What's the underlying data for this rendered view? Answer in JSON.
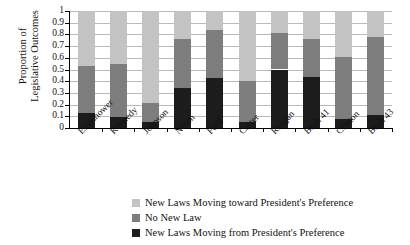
{
  "chart_data": {
    "type": "bar",
    "title": "",
    "xlabel": "",
    "ylabel": "Proportion of Legislative Outcomes",
    "ylabel_line1": "Proportion of",
    "ylabel_line2": "Legislative Outcomes",
    "ylim": [
      0,
      1
    ],
    "grid": true,
    "stacked": true,
    "stack_mode": "proportional",
    "legend_position": "bottom",
    "ytick_labels": [
      "1",
      "0.9",
      "0.8",
      "0.7",
      "0.6",
      "0.5",
      "0.4",
      "0.3",
      "0.2",
      "0.1",
      "0"
    ],
    "ytick_values": [
      1,
      0.9,
      0.8,
      0.7,
      0.6,
      0.5,
      0.4,
      0.3,
      0.2,
      0.1,
      0
    ],
    "categories": [
      "Eisenhower",
      "Kennedy",
      "Johnson",
      "Nixon",
      "Ford",
      "Carter",
      "Reagan",
      "Bush 41",
      "Clinton",
      "Bush 43"
    ],
    "series": [
      {
        "name": "New Laws Moving from President's Preference",
        "color": "#1c1c1c",
        "values": [
          0.13,
          0.09,
          0.05,
          0.34,
          0.43,
          0.05,
          0.5,
          0.44,
          0.08,
          0.11
        ]
      },
      {
        "name": "No New Law",
        "color": "#7d7d7d",
        "values": [
          0.4,
          0.46,
          0.16,
          0.42,
          0.41,
          0.35,
          0.31,
          0.32,
          0.53,
          0.67
        ]
      },
      {
        "name": "New Laws Moving toward President's Preference",
        "color": "#c3c3c3",
        "values": [
          0.47,
          0.45,
          0.79,
          0.24,
          0.16,
          0.6,
          0.19,
          0.24,
          0.39,
          0.22
        ]
      }
    ],
    "cumulative_tops": {
      "from_president": [
        0.13,
        0.09,
        0.05,
        0.34,
        0.43,
        0.05,
        0.5,
        0.44,
        0.08,
        0.11
      ],
      "no_new_law": [
        0.53,
        0.55,
        0.21,
        0.76,
        0.84,
        0.4,
        0.81,
        0.76,
        0.61,
        0.78
      ],
      "toward_president": [
        1,
        1,
        1,
        1,
        1,
        1,
        1,
        1,
        1,
        1
      ]
    }
  },
  "legend": {
    "items": [
      {
        "label": "New Laws Moving toward President's Preference",
        "color": "#c3c3c3"
      },
      {
        "label": "No New Law",
        "color": "#7d7d7d"
      },
      {
        "label": "New Laws Moving from President's Preference",
        "color": "#1c1c1c"
      }
    ]
  }
}
